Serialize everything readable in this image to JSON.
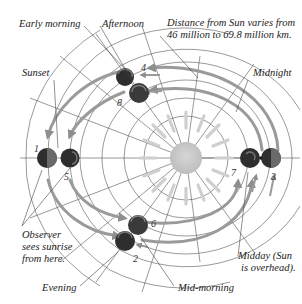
{
  "labels": {
    "early_morning": "Early morning",
    "afternoon": "Afternoon",
    "distance_note_line1": "Distance from Sun varies from",
    "distance_note_line2": "46 million to 69.8 million km.",
    "sunset": "Sunset",
    "midnight": "Midnight",
    "observer_line1": "Observer",
    "observer_line2": "sees sunrise",
    "observer_line3": "from here.",
    "midday_line1": "Midday (Sun",
    "midday_line2": "is overhead).",
    "evening": "Evening",
    "mid_morning": "Mid-morning"
  },
  "positions": [
    "1",
    "2",
    "3",
    "4",
    "5",
    "6",
    "7",
    "8"
  ],
  "colors": {
    "sun": "#c8c8c8",
    "rays": "#cfcfcf",
    "grid": "#555555",
    "arrow": "#9a9a9a",
    "planet_dark": "#2e2e2e",
    "planet_mid": "#6a6a6a",
    "text": "#222222"
  }
}
